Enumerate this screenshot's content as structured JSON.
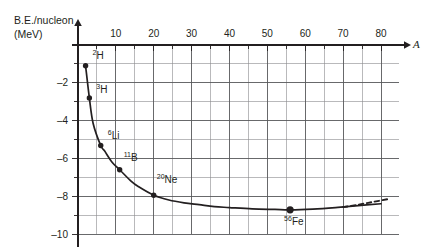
{
  "chart_data": {
    "type": "line",
    "title": "",
    "subtitle": "",
    "xlabel": "A",
    "ylabel_line1": "B.E./nucleon",
    "ylabel_line2": "(MeV)",
    "xlim": [
      0,
      82
    ],
    "ylim": [
      -10,
      0
    ],
    "grid": true,
    "legend": "none",
    "x_major_ticks": [
      10,
      20,
      30,
      40,
      50,
      60,
      70,
      80
    ],
    "x_major_tick_labels": [
      "10",
      "20",
      "30",
      "40",
      "50",
      "60",
      "70",
      "80"
    ],
    "x_minor_tick_step": 5,
    "y_major_ticks": [
      -2,
      -4,
      -6,
      -8,
      -10
    ],
    "y_major_tick_labels": [
      "–2",
      "–4",
      "–6",
      "–8",
      "–10"
    ],
    "y_minor_tick_step": 1,
    "series": [
      {
        "name": "binding-energy-per-nucleon",
        "style": "solid",
        "x": [
          2,
          3,
          4,
          6,
          7,
          9,
          11,
          14,
          16,
          20,
          24,
          28,
          32,
          36,
          40,
          46,
          52,
          56,
          62,
          68,
          74,
          80
        ],
        "y": [
          -1.1,
          -2.8,
          -4.15,
          -5.32,
          -5.6,
          -6.2,
          -6.6,
          -7.2,
          -7.5,
          -7.95,
          -8.2,
          -8.35,
          -8.45,
          -8.55,
          -8.6,
          -8.67,
          -8.7,
          -8.72,
          -8.68,
          -8.6,
          -8.5,
          -8.4
        ]
      },
      {
        "name": "extrapolation-dashed",
        "style": "dashed",
        "x": [
          70,
          74,
          78,
          82
        ],
        "y": [
          -8.58,
          -8.45,
          -8.3,
          -8.15
        ]
      }
    ],
    "annotations": [
      {
        "label_sup": "2",
        "label_base": "H",
        "x": 2,
        "y": -1.1,
        "marker": "dot",
        "label_dx": 7,
        "label_dy": -7
      },
      {
        "label_sup": "3",
        "label_base": "H",
        "x": 3,
        "y": -2.8,
        "marker": "dot",
        "label_dx": 7,
        "label_dy": -5
      },
      {
        "label_sup": "6",
        "label_base": "Li",
        "x": 6,
        "y": -5.32,
        "marker": "dot",
        "label_dx": 7,
        "label_dy": -7
      },
      {
        "label_sup": "11",
        "label_base": "B",
        "x": 11,
        "y": -6.6,
        "marker": "dot",
        "label_dx": 4,
        "label_dy": -9
      },
      {
        "label_sup": "20",
        "label_base": "Ne",
        "x": 20,
        "y": -7.95,
        "marker": "dot",
        "label_dx": 3,
        "label_dy": -12
      },
      {
        "label_sup": "56",
        "label_base": "Fe",
        "x": 56,
        "y": -8.72,
        "marker": "dot-large",
        "label_dx": -6,
        "label_dy": 15
      }
    ],
    "colors": {
      "background": "#ffffff",
      "curve": "#231f20",
      "grid_major": "#58595b",
      "grid_minor": "#8a8b8d",
      "axis": "#231f20",
      "text": "#231f20"
    }
  }
}
